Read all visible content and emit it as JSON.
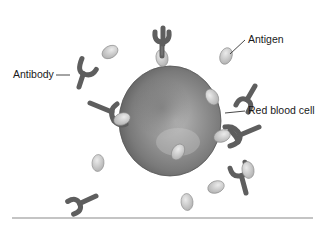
{
  "diagram": {
    "labels": {
      "antibody": "Antibody",
      "antigen": "Antigen",
      "red_blood_cell": "Red blood cell"
    },
    "colors": {
      "cell_light": "#c9c9c9",
      "cell_dark": "#6e6e6e",
      "antibody": "#6a6a6a",
      "antigen": "#d4d4d4",
      "rule": "#8a8a8a"
    }
  }
}
